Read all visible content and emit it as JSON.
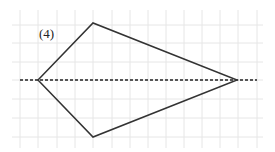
{
  "figure": {
    "label": "(4)",
    "grid": {
      "color": "#e6e6e6",
      "vertical_x": [
        20,
        38,
        57,
        75,
        93,
        112,
        130,
        148,
        166,
        184,
        202,
        220,
        238,
        257
      ],
      "horizontal_y": [
        25,
        43,
        62,
        80,
        99,
        118,
        137
      ],
      "x_range": [
        12,
        263
      ],
      "y_range": [
        10,
        148
      ]
    },
    "shape": {
      "type": "kite",
      "stroke": "#333333",
      "vertices": {
        "left": [
          38,
          80
        ],
        "top": [
          93,
          23
        ],
        "right": [
          237,
          80
        ],
        "bottom": [
          93,
          137
        ]
      }
    },
    "axis_line": {
      "style": "dashed",
      "color": "#222222",
      "from": [
        20,
        80
      ],
      "to": [
        257,
        80
      ]
    }
  }
}
